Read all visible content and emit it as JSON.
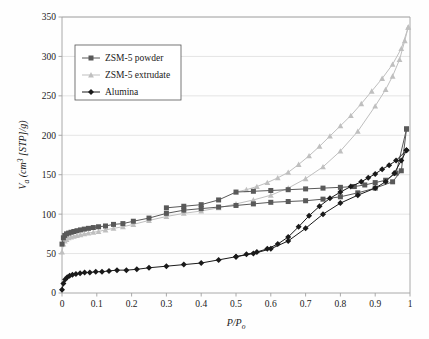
{
  "figure": {
    "background_color": "#fefefe",
    "plot_border_color": "#a0a0a0",
    "grid_color": "#d9d9d9"
  },
  "legend": {
    "position": "upper-left",
    "border_color": "#555555",
    "entries": [
      {
        "label": "ZSM-5 powder",
        "color": "#595959",
        "marker": "square"
      },
      {
        "label": "ZSM-5 extrudate",
        "color": "#bfbfbf",
        "marker": "triangle"
      },
      {
        "label": "Alumina",
        "color": "#1a1a1a",
        "marker": "diamond"
      }
    ]
  },
  "chart_data": {
    "type": "line",
    "title": "",
    "subtitle": "",
    "xlabel": "P/P_o",
    "xlabel_parts": {
      "main": "P/P",
      "sub": "o"
    },
    "ylabel": "V_a (cm^3 [STP]/g)",
    "ylabel_parts": {
      "v": "V",
      "v_sub": "a",
      "rest_pre": " (cm",
      "sup": "3",
      "rest_post": " [STP]/g)"
    },
    "xlim": [
      0,
      1
    ],
    "ylim": [
      0,
      350
    ],
    "xticks": [
      0,
      0.1,
      0.2,
      0.3,
      0.4,
      0.5,
      0.6,
      0.7,
      0.8,
      0.9,
      1
    ],
    "xticklabels": [
      "0",
      "0.1",
      "0.2",
      "0.3",
      "0.4",
      "0.5",
      "0.6",
      "0.7",
      "0.8",
      "0.9",
      "1"
    ],
    "yticks": [
      0,
      50,
      100,
      150,
      200,
      250,
      300,
      350
    ],
    "yticklabels": [
      "0",
      "50",
      "100",
      "150",
      "200",
      "250",
      "300",
      "350"
    ],
    "grid": "horizontal",
    "legend_position": "upper left",
    "series": [
      {
        "name": "ZSM-5 powder",
        "branch": "adsorption",
        "color": "#595959",
        "marker": "square",
        "x": [
          0.0,
          0.004,
          0.008,
          0.013,
          0.019,
          0.026,
          0.034,
          0.043,
          0.053,
          0.064,
          0.076,
          0.09,
          0.105,
          0.125,
          0.148,
          0.175,
          0.205,
          0.25,
          0.3,
          0.35,
          0.4,
          0.45,
          0.5,
          0.55,
          0.6,
          0.65,
          0.7,
          0.75,
          0.8,
          0.85,
          0.9,
          0.95,
          0.975,
          0.99
        ],
        "y": [
          62,
          70,
          73,
          75,
          76,
          77,
          78,
          79,
          80,
          81,
          82,
          83,
          84,
          85,
          87,
          88,
          91,
          95,
          101,
          105,
          107,
          109,
          111,
          113,
          115,
          116,
          117,
          119,
          122,
          127,
          133,
          141,
          155,
          208
        ]
      },
      {
        "name": "ZSM-5 powder",
        "branch": "desorption",
        "color": "#595959",
        "marker": "square",
        "x": [
          0.99,
          0.96,
          0.93,
          0.9,
          0.87,
          0.84,
          0.8,
          0.75,
          0.7,
          0.65,
          0.6,
          0.55,
          0.5,
          0.45,
          0.4,
          0.35,
          0.3
        ],
        "y": [
          208,
          152,
          143,
          140,
          137,
          135,
          134,
          133,
          132,
          131,
          130,
          129,
          128,
          118,
          112,
          110,
          108
        ]
      },
      {
        "name": "ZSM-5 extrudate",
        "branch": "adsorption",
        "color": "#bfbfbf",
        "marker": "triangle",
        "x": [
          0.0,
          0.004,
          0.008,
          0.013,
          0.019,
          0.026,
          0.034,
          0.043,
          0.053,
          0.064,
          0.076,
          0.09,
          0.105,
          0.125,
          0.148,
          0.175,
          0.205,
          0.25,
          0.3,
          0.35,
          0.4,
          0.45,
          0.5,
          0.55,
          0.6,
          0.65,
          0.7,
          0.75,
          0.8,
          0.85,
          0.9,
          0.93,
          0.95,
          0.97,
          0.985,
          0.995
        ],
        "y": [
          52,
          62,
          66,
          68,
          70,
          71,
          72,
          73,
          74,
          75,
          76,
          77,
          78,
          80,
          82,
          84,
          87,
          92,
          97,
          101,
          104,
          108,
          113,
          118,
          124,
          133,
          145,
          160,
          180,
          205,
          237,
          258,
          275,
          296,
          320,
          337
        ]
      },
      {
        "name": "ZSM-5 extrudate",
        "branch": "desorption",
        "color": "#bfbfbf",
        "marker": "triangle",
        "x": [
          0.995,
          0.975,
          0.95,
          0.92,
          0.89,
          0.86,
          0.83,
          0.8,
          0.77,
          0.74,
          0.71,
          0.68,
          0.65,
          0.62,
          0.59,
          0.56,
          0.53,
          0.5
        ],
        "y": [
          337,
          310,
          290,
          272,
          256,
          240,
          225,
          212,
          199,
          186,
          174,
          163,
          153,
          146,
          140,
          135,
          131,
          128
        ]
      },
      {
        "name": "Alumina",
        "branch": "adsorption",
        "color": "#1a1a1a",
        "marker": "diamond",
        "x": [
          0.0,
          0.004,
          0.009,
          0.015,
          0.022,
          0.03,
          0.04,
          0.052,
          0.065,
          0.08,
          0.097,
          0.115,
          0.135,
          0.158,
          0.185,
          0.215,
          0.25,
          0.3,
          0.35,
          0.4,
          0.45,
          0.5,
          0.55,
          0.6,
          0.65,
          0.7,
          0.75,
          0.8,
          0.85,
          0.9,
          0.93,
          0.955,
          0.975,
          0.99
        ],
        "y": [
          4,
          12,
          17,
          20,
          22,
          23,
          24,
          25,
          26,
          26,
          27,
          27,
          28,
          29,
          29,
          30,
          32,
          34,
          36,
          38,
          42,
          46,
          50,
          56,
          66,
          82,
          100,
          114,
          124,
          133,
          141,
          152,
          168,
          181
        ]
      },
      {
        "name": "Alumina",
        "branch": "desorption",
        "color": "#1a1a1a",
        "marker": "diamond",
        "x": [
          0.99,
          0.96,
          0.94,
          0.92,
          0.9,
          0.88,
          0.86,
          0.83,
          0.8,
          0.77,
          0.74,
          0.71,
          0.68,
          0.65,
          0.62,
          0.59,
          0.56,
          0.53,
          0.5
        ],
        "y": [
          181,
          168,
          162,
          157,
          151,
          146,
          141,
          135,
          128,
          120,
          110,
          98,
          84,
          71,
          62,
          56,
          52,
          49,
          46
        ]
      }
    ]
  }
}
